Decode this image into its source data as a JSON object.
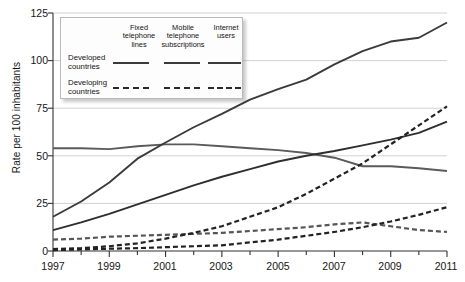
{
  "chart_data": {
    "type": "line",
    "title": "",
    "xlabel": "",
    "ylabel": "Rate per 100 inhabitants",
    "xlim": [
      1997,
      2011
    ],
    "ylim": [
      0,
      125
    ],
    "yticks": [
      0,
      25,
      50,
      75,
      100,
      125
    ],
    "xticks": [
      1997,
      1999,
      2001,
      2003,
      2005,
      2007,
      2009,
      2011
    ],
    "xtick_labels": [
      "1997",
      "1999",
      "2001",
      "2003",
      "2005",
      "2007",
      "2009",
      "2011"
    ],
    "ytick_labels": [
      "0",
      "25",
      "50",
      "75",
      "100",
      "125"
    ],
    "x": [
      1997,
      1998,
      1999,
      2000,
      2001,
      2002,
      2003,
      2004,
      2005,
      2006,
      2007,
      2008,
      2009,
      2010,
      2011
    ],
    "grid": "horizontal",
    "legend_position": "top-left-inside",
    "series": [
      {
        "name": "Developed countries - Fixed telephone lines",
        "group": "Developed countries",
        "metric": "Fixed telephone lines",
        "style": "solid",
        "color": "#5a5a5a",
        "values": [
          54,
          54,
          53.5,
          55,
          56,
          56,
          55,
          54,
          53,
          51.5,
          49,
          44.5,
          44.5,
          43.5,
          42
        ]
      },
      {
        "name": "Developed countries - Mobile telephone subscriptions",
        "group": "Developed countries",
        "metric": "Mobile telephone subscriptions",
        "style": "solid",
        "color": "#3a3a3a",
        "values": [
          18,
          26,
          36,
          48.5,
          57,
          65,
          72,
          79.5,
          85,
          90,
          98,
          105,
          110,
          112,
          120
        ]
      },
      {
        "name": "Developed countries - Internet users",
        "group": "Developed countries",
        "metric": "Internet users",
        "style": "solid",
        "color": "#2e2e2e",
        "values": [
          11,
          15,
          19.5,
          24.5,
          29.5,
          34.5,
          39,
          43,
          47,
          50,
          52.5,
          55.5,
          58.5,
          62,
          68
        ]
      },
      {
        "name": "Developing countries - Fixed telephone lines",
        "group": "Developing countries",
        "metric": "Fixed telephone lines",
        "style": "dashed",
        "color": "#565656",
        "values": [
          6,
          6.5,
          7.5,
          8,
          8.5,
          9,
          9.5,
          10.5,
          11.5,
          12.5,
          14,
          15,
          13,
          11,
          10
        ]
      },
      {
        "name": "Developing countries - Mobile telephone subscriptions",
        "group": "Developing countries",
        "metric": "Mobile telephone subscriptions",
        "style": "dashed",
        "color": "#222222",
        "values": [
          1,
          1.5,
          2.5,
          4,
          6.5,
          9.5,
          13,
          18,
          23,
          30,
          38,
          46,
          56,
          66,
          76
        ]
      },
      {
        "name": "Developing countries - Internet users",
        "group": "Developing countries",
        "metric": "Internet users",
        "style": "dashed",
        "color": "#222222",
        "values": [
          0.5,
          0.8,
          1.2,
          1.5,
          2,
          2.5,
          3,
          4.5,
          6,
          8,
          10,
          12.5,
          15.5,
          19,
          23
        ]
      }
    ]
  },
  "legend": {
    "columns": [
      {
        "label": "Fixed\ntelephone\nlines",
        "line1": "Fixed",
        "line2": "telephone",
        "line3": "lines"
      },
      {
        "label": "Mobile\ntelephone\nsubscriptions",
        "line1": "Mobile",
        "line2": "telephone",
        "line3": "subscriptions"
      },
      {
        "label": "Internet\nusers",
        "line1": "Internet",
        "line2": "users",
        "line3": ""
      }
    ],
    "rows": [
      {
        "line1": "Developed",
        "line2": "countries",
        "style": "solid"
      },
      {
        "line1": "Developing",
        "line2": "countries",
        "style": "dashed"
      }
    ]
  }
}
